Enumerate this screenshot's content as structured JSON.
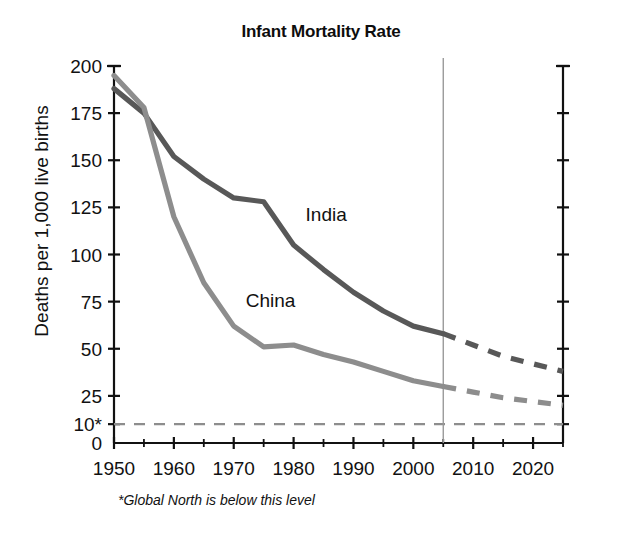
{
  "chart_data": {
    "type": "line",
    "title": "Infant Mortality Rate",
    "xlabel": "",
    "ylabel": "Deaths per 1,000 live births",
    "xlim": [
      1950,
      2025
    ],
    "ylim": [
      0,
      200
    ],
    "grid": false,
    "legend_position": "inline-labels",
    "x": [
      1950,
      1955,
      1960,
      1965,
      1970,
      1975,
      1980,
      1985,
      1990,
      1995,
      2000,
      2005
    ],
    "x_projected": [
      2005,
      2010,
      2015,
      2020,
      2025
    ],
    "series": [
      {
        "name": "India",
        "color": "#585858",
        "values": [
          188,
          175,
          152,
          140,
          130,
          128,
          105,
          92,
          80,
          70,
          62,
          58
        ],
        "projected_values": [
          58,
          52,
          46,
          42,
          38
        ],
        "label": "India",
        "style": "solid-then-dashed"
      },
      {
        "name": "China",
        "color": "#8d8d8d",
        "values": [
          195,
          178,
          120,
          85,
          62,
          51,
          52,
          47,
          43,
          38,
          33,
          30
        ],
        "projected_values": [
          30,
          27,
          24,
          22,
          20
        ],
        "label": "China",
        "style": "solid-then-dashed"
      }
    ],
    "y_ticks": [
      0,
      10,
      25,
      50,
      75,
      100,
      125,
      150,
      175,
      200
    ],
    "y_tick_labels": [
      "0",
      "10*",
      "25",
      "50",
      "75",
      "100",
      "125",
      "150",
      "175",
      "200"
    ],
    "x_ticks": [
      1950,
      1960,
      1970,
      1980,
      1990,
      2000,
      2010,
      2020
    ],
    "x_tick_labels": [
      "1950",
      "1960",
      "1970",
      "1980",
      "1990",
      "2000",
      "2010",
      "2020"
    ],
    "x_minor_ticks": [
      1955,
      1965,
      1975,
      1985,
      1995,
      2005,
      2015,
      2025
    ],
    "reference_line": {
      "value": 10,
      "label": "10*",
      "style": "dashed",
      "color": "#8d8d8d"
    },
    "divider_line": {
      "value": 2005,
      "style": "solid",
      "color": "#9a9a9a",
      "meaning": "projection-start"
    },
    "footnote": "*Global North is below this level",
    "annotations": [
      {
        "text": "India",
        "x": 1982,
        "y": 118
      },
      {
        "text": "China",
        "x": 1972,
        "y": 72
      }
    ]
  },
  "axis": {
    "y_title": "Deaths per 1,000 live births",
    "right_axis_labeled": false
  }
}
